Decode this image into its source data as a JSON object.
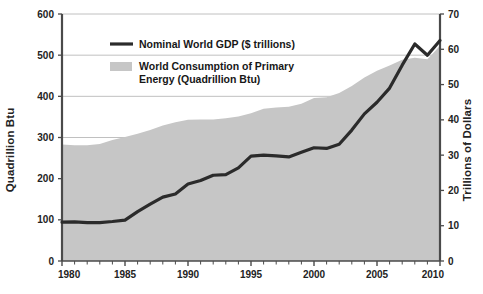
{
  "chart_data": {
    "type": "area",
    "title": "",
    "subtitle": "",
    "xlabel": "",
    "ylabel": "Quadrillion Btu",
    "y2label": "Trillions of Dollars",
    "grid": true,
    "legend_position": "top-center",
    "xlim": [
      1980,
      2010
    ],
    "ylim": [
      0,
      600
    ],
    "y2lim": [
      0,
      70
    ],
    "x_ticks_major": [
      1980,
      1985,
      1990,
      1995,
      2000,
      2005,
      2010
    ],
    "x_tick_labels": [
      "1980",
      "1985",
      "1990",
      "1995",
      "2000",
      "2005",
      "2010"
    ],
    "x_ticks_minor_step": 1,
    "y_ticks": [
      0,
      100,
      200,
      300,
      400,
      500,
      600
    ],
    "y_tick_labels": [
      "0",
      "100",
      "200",
      "300",
      "400",
      "500",
      "600"
    ],
    "y2_ticks": [
      0,
      10,
      20,
      30,
      40,
      50,
      60,
      70
    ],
    "y2_tick_labels": [
      "0",
      "10",
      "20",
      "30",
      "40",
      "50",
      "60",
      "70"
    ],
    "x": [
      1980,
      1981,
      1982,
      1983,
      1984,
      1985,
      1986,
      1987,
      1988,
      1989,
      1990,
      1991,
      1992,
      1993,
      1994,
      1995,
      1996,
      1997,
      1998,
      1999,
      2000,
      2001,
      2002,
      2003,
      2004,
      2005,
      2006,
      2007,
      2008,
      2009,
      2010
    ],
    "series": [
      {
        "name": "World Consumption of Primary Energy (Quadrillion Btu)",
        "axis": "left",
        "type": "area",
        "color": "#c6c6c6",
        "unit": "Quadrillion Btu",
        "values": [
          283,
          281,
          281,
          284,
          294,
          301,
          309,
          318,
          329,
          337,
          343,
          344,
          344,
          347,
          351,
          359,
          370,
          373,
          375,
          382,
          396,
          398,
          408,
          425,
          446,
          462,
          475,
          489,
          494,
          490,
          523
        ]
      },
      {
        "name": "Nominal World GDP ($ trillions)",
        "axis": "right",
        "type": "line",
        "color": "#2b2b2b",
        "unit": "$ trillions",
        "values": [
          11.0,
          11.1,
          10.9,
          10.9,
          11.2,
          11.6,
          14.0,
          16.1,
          18.1,
          19.0,
          21.8,
          22.8,
          24.3,
          24.5,
          26.4,
          29.7,
          30.0,
          29.8,
          29.5,
          30.8,
          32.1,
          31.9,
          33.1,
          37.1,
          41.7,
          45.0,
          49.0,
          55.5,
          61.5,
          58.3,
          62.5
        ]
      }
    ],
    "legend": [
      {
        "label": "Nominal World GDP ($ trillions)",
        "marker": "line",
        "color": "#2b2b2b"
      },
      {
        "label": "World Consumption of Primary\nEnergy (Quadrillion Btu)",
        "label_line1": "World Consumption of Primary",
        "label_line2": "Energy (Quadrillion Btu)",
        "marker": "swatch",
        "color": "#c6c6c6"
      }
    ],
    "colors": {
      "area_fill": "#c6c6c6",
      "line": "#2b2b2b",
      "axis": "#4a4a4a",
      "grid": "#b9b9b9",
      "text": "#232323",
      "background": "#ffffff"
    }
  }
}
